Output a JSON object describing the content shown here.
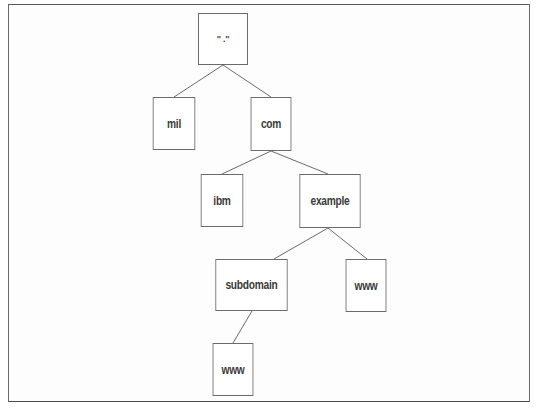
{
  "diagram": {
    "title": "",
    "type": "tree",
    "colors": {
      "frame": "#5a5a5a",
      "node_border": "#6b6b6b",
      "edge": "#6b6b6b",
      "text": "#3a3a3a",
      "background": "#ffffff"
    },
    "nodes": [
      {
        "id": "root",
        "label": "\" .\""
      },
      {
        "id": "mil",
        "label": "mil"
      },
      {
        "id": "com",
        "label": "com"
      },
      {
        "id": "ibm",
        "label": "ibm"
      },
      {
        "id": "example",
        "label": "example"
      },
      {
        "id": "subdomain",
        "label": "subdomain"
      },
      {
        "id": "www_example",
        "label": "www"
      },
      {
        "id": "www_subdomain",
        "label": "www"
      }
    ],
    "edges": [
      {
        "from": "root",
        "to": "mil"
      },
      {
        "from": "root",
        "to": "com"
      },
      {
        "from": "com",
        "to": "ibm"
      },
      {
        "from": "com",
        "to": "example"
      },
      {
        "from": "example",
        "to": "subdomain"
      },
      {
        "from": "example",
        "to": "www_example"
      },
      {
        "from": "subdomain",
        "to": "www_subdomain"
      }
    ]
  }
}
